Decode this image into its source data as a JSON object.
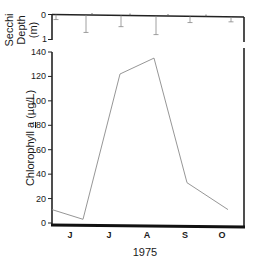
{
  "chart_data": [
    {
      "type": "bar",
      "title": "",
      "ylabel": "Secchi Depth (m)",
      "ylabel_lines": [
        "Secchi",
        "Depth",
        "(m)"
      ],
      "ylim": [
        0,
        1
      ],
      "y_inverted": true,
      "yticks": [
        "0",
        "1"
      ],
      "x_positions_px": [
        56,
        86,
        121,
        156,
        190,
        231
      ],
      "values": [
        0.2,
        0.7,
        0.45,
        0.75,
        0.25,
        0.2
      ],
      "style": "thin drop lines with end caps hanging from top axis"
    },
    {
      "type": "line",
      "title": "",
      "xlabel": "1975",
      "ylabel": "Chlorophyll a (µg/L)",
      "ylabel_parts": [
        "Chlorophyll ",
        "a",
        " (µg/L)"
      ],
      "ylim": [
        0,
        140
      ],
      "yticks": [
        "0",
        "20",
        "40",
        "60",
        "80",
        "100",
        "120",
        "140"
      ],
      "categories": [
        "J",
        "J",
        "A",
        "S",
        "O"
      ],
      "x_positions_px": [
        52,
        83,
        120,
        154,
        187,
        228
      ],
      "values": [
        11,
        3,
        122,
        135,
        33,
        11
      ],
      "grid": false,
      "legend": null
    }
  ]
}
